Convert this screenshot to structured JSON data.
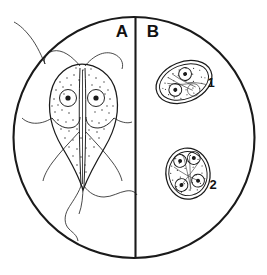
{
  "figure": {
    "background_color": "#ffffff",
    "ink_color": "#1a1a1a",
    "field": {
      "shape": "circle",
      "center_x": 134,
      "center_y": 137,
      "radius": 121,
      "description": "microscope field of view outline"
    },
    "divider": {
      "orientation": "vertical",
      "x": 135,
      "description": "vertical line splitting the field into panel A and panel B"
    }
  },
  "panels": [
    {
      "id": "A",
      "label": "A",
      "label_x": 122,
      "label_y": 36,
      "content": "trophozoite",
      "description": "pear-shaped binucleate trophozoite with stippled cytoplasm, axostyle, ventral disc margin and eight flagella"
    },
    {
      "id": "B",
      "label": "B",
      "label_x": 152,
      "label_y": 36,
      "content": "cysts",
      "description": "two oval cysts with double cyst wall, stippled cytoplasm and internal nuclei"
    }
  ],
  "specimens": [
    {
      "name": "trophozoite",
      "panel": "A",
      "nuclei_count": 2,
      "nuclei": [
        {
          "cx": 68,
          "cy": 98,
          "r": 8.5,
          "karyosome_r": 2.6
        },
        {
          "cx": 96,
          "cy": 98,
          "r": 8.5,
          "karyosome_r": 2.6
        }
      ],
      "flagella_count": 8
    },
    {
      "name": "cyst",
      "panel": "B",
      "label": "1",
      "label_x": 211,
      "label_y": 82,
      "shape": "oval",
      "tilt_degrees": -22,
      "center_x": 184,
      "center_y": 82,
      "nuclei_count": 3,
      "nuclei": [
        {
          "cx": 190,
          "cy": 73,
          "r": 6.4,
          "karyosome_r": 2.0
        },
        {
          "cx": 175,
          "cy": 85,
          "r": 6.4,
          "karyosome_r": 2.0
        },
        {
          "cx": 190,
          "cy": 93,
          "r": 6.4,
          "karyosome_r": 1.6
        }
      ]
    },
    {
      "name": "cyst",
      "panel": "B",
      "label": "2",
      "label_x": 212,
      "label_y": 184,
      "shape": "egg",
      "tilt_degrees": -8,
      "center_x": 188,
      "center_y": 174,
      "nuclei_count": 4,
      "nuclei": [
        {
          "cx": 182,
          "cy": 160,
          "r": 6.4,
          "karyosome_r": 2.0
        },
        {
          "cx": 196,
          "cy": 159,
          "r": 6.4,
          "karyosome_r": 2.0
        },
        {
          "cx": 180,
          "cy": 184,
          "r": 6.4,
          "karyosome_r": 2.0
        },
        {
          "cx": 197,
          "cy": 182,
          "r": 6.4,
          "karyosome_r": 2.0
        }
      ]
    }
  ],
  "labels": {
    "panel_a": "A",
    "panel_b": "B",
    "cyst_one": "1",
    "cyst_two": "2"
  }
}
